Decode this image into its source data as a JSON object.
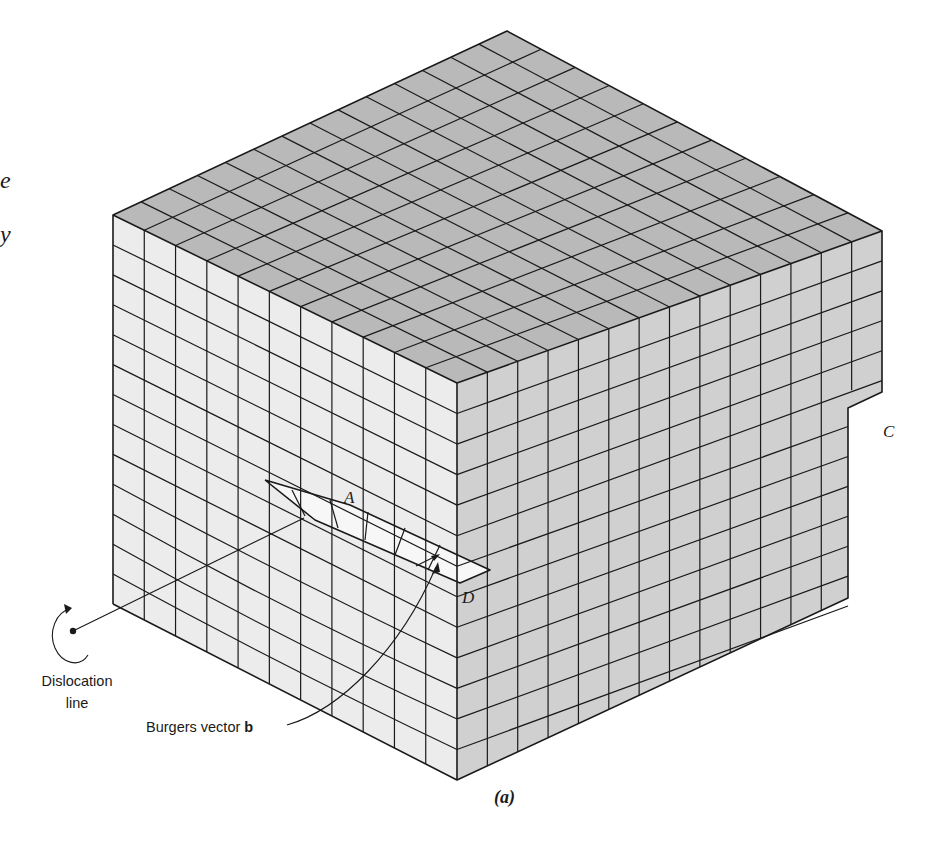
{
  "figure": {
    "caption": "(a)",
    "colors": {
      "top_face": "#b9b9b9",
      "left_face": "#ececec",
      "right_face": "#d0d0d0",
      "slip_step": "#f7f7f7",
      "lines": "#1a1a1a",
      "background": "#ffffff"
    },
    "point_labels": [
      {
        "id": "A",
        "text": "A",
        "x": 344,
        "y": 503
      },
      {
        "id": "C",
        "text": "C",
        "x": 883,
        "y": 437
      },
      {
        "id": "D",
        "text": "D",
        "x": 462,
        "y": 603
      }
    ],
    "callouts": {
      "dislocation_line": {
        "line1": "Dislocation",
        "line2": "line"
      },
      "burgers_vector": {
        "text": "Burgers vector ",
        "symbol": "b"
      }
    },
    "margin_text_fragments": [
      {
        "text": "e",
        "x": 0,
        "y": 188
      },
      {
        "text": "y",
        "x": 0,
        "y": 242
      }
    ],
    "lattice": {
      "columns_left_face": 11,
      "columns_right_face": 14,
      "rows": 13
    }
  }
}
